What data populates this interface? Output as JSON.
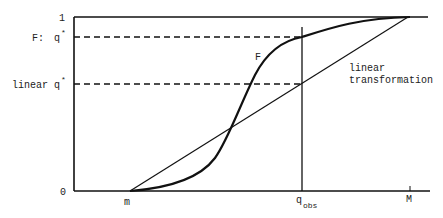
{
  "diagram": {
    "y_axis": {
      "top_label": "1",
      "bottom_label": "0",
      "F_prefix": "F:",
      "F_q": "q",
      "linear_prefix": "linear",
      "linear_q": "q",
      "star": "*"
    },
    "x_axis": {
      "m_label": "m",
      "q_obs_base": "q",
      "q_obs_sub": "obs",
      "M_label": "M"
    },
    "curve_label": "F",
    "line_label": [
      "linear",
      "transformation"
    ],
    "colors": {
      "ink": "#111111",
      "background": "#ffffff"
    }
  }
}
